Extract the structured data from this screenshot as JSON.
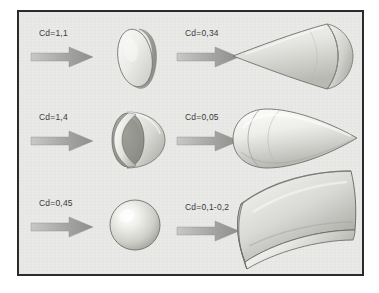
{
  "figure": {
    "background_color": "#e9e9e7",
    "frame_color": "#2b2b2b",
    "arrow_color": "#9a9a9a",
    "label_color": "#3a3a3a"
  },
  "columns": [
    {
      "id": "left-column",
      "name": "bluff-bodies"
    },
    {
      "id": "right-column",
      "name": "streamlined-bodies"
    }
  ],
  "rows": [
    {
      "id": "row-1",
      "name": "disc-and-cone"
    },
    {
      "id": "row-2",
      "name": "cup-and-teardrop"
    },
    {
      "id": "row-3",
      "name": "sphere-and-airfoil"
    }
  ],
  "cells": [
    {
      "id": "cell-disc",
      "row": 1,
      "column": "left",
      "cd_label": "Cd=1,1",
      "cd_value": 1.1,
      "shape_name": "flat-disc",
      "shape_description": "flat circular disc facing the flow",
      "arrow_name": "flow-arrow-disc",
      "arrow_direction": "right"
    },
    {
      "id": "cell-cone",
      "row": 1,
      "column": "right",
      "cd_label": "Cd=0,34",
      "cd_value": 0.34,
      "shape_name": "cone",
      "shape_description": "cone with apex pointing into the flow and rounded base",
      "arrow_name": "flow-arrow-cone",
      "arrow_direction": "right"
    },
    {
      "id": "cell-cup",
      "row": 2,
      "column": "left",
      "cd_label": "Cd=1,4",
      "cd_value": 1.4,
      "shape_name": "hollow-hemisphere-cup",
      "shape_description": "hollow hemispherical cup with its opening facing the flow",
      "arrow_name": "flow-arrow-cup",
      "arrow_direction": "right"
    },
    {
      "id": "cell-teardrop",
      "row": 2,
      "column": "right",
      "cd_label": "Cd=0,05",
      "cd_value": 0.05,
      "shape_name": "teardrop-streamlined-body",
      "shape_description": "streamlined teardrop body, rounded nose into the flow, tapering to a point",
      "arrow_name": "flow-arrow-teardrop",
      "arrow_direction": "right"
    },
    {
      "id": "cell-sphere",
      "row": 3,
      "column": "left",
      "cd_label": "Cd=0,45",
      "cd_value": 0.45,
      "shape_name": "sphere",
      "shape_description": "solid sphere",
      "arrow_name": "flow-arrow-sphere",
      "arrow_direction": "right"
    },
    {
      "id": "cell-airfoil",
      "row": 3,
      "column": "right",
      "cd_label": "Cd=0,1-0,2",
      "cd_value_min": 0.1,
      "cd_value_max": 0.2,
      "shape_name": "curved-airfoil-panel",
      "shape_description": "curved wing / airfoil panel seen in perspective",
      "arrow_name": "flow-arrow-airfoil",
      "arrow_direction": "right"
    }
  ]
}
